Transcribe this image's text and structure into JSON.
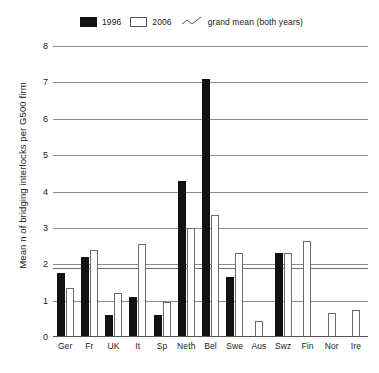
{
  "chart_data": {
    "type": "bar",
    "title": "",
    "xlabel": "",
    "ylabel": "Mean n of bridging interlocks per G500 firm",
    "ylim": [
      0,
      8
    ],
    "yticks": [
      0,
      1,
      2,
      3,
      4,
      5,
      6,
      7,
      8
    ],
    "grid": true,
    "legend_position": "top",
    "categories": [
      "Ger",
      "Fr",
      "UK",
      "It",
      "Sp",
      "Neth",
      "Bel",
      "Swe",
      "Aus",
      "Swz",
      "Fin",
      "Nor",
      "Ire"
    ],
    "series": [
      {
        "name": "1996",
        "color": "#111111",
        "values": [
          1.75,
          2.2,
          0.6,
          1.1,
          0.6,
          4.3,
          7.1,
          1.65,
          0,
          2.3,
          0,
          0,
          0
        ]
      },
      {
        "name": "2006",
        "color": "#ffffff",
        "values": [
          1.35,
          2.4,
          1.2,
          2.55,
          0.95,
          3.0,
          3.35,
          2.3,
          0.45,
          2.3,
          2.65,
          0.65,
          0.75
        ]
      }
    ],
    "annotations": [
      {
        "name": "grand mean (both years)",
        "type": "hline",
        "value": 1.9
      }
    ]
  },
  "legend": {
    "items": [
      {
        "label": "1996",
        "swatch": "filled-square-icon"
      },
      {
        "label": "2006",
        "swatch": "hollow-square-icon"
      },
      {
        "label": "grand mean (both years)",
        "swatch": "zigzag-line-icon"
      }
    ]
  }
}
